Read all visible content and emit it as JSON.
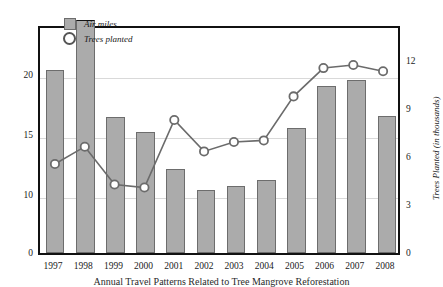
{
  "chart_data": {
    "type": "bar",
    "title": "",
    "categories": [
      "1997",
      "1998",
      "1999",
      "2000",
      "2001",
      "2002",
      "2003",
      "2004",
      "2005",
      "2006",
      "2007",
      "2008"
    ],
    "series": [
      {
        "name": "Air miles",
        "type": "bar",
        "axis": "left",
        "unit": "millions",
        "color": "#ababab",
        "values": [
          20.3,
          24.5,
          16.4,
          15.2,
          12.1,
          10.3,
          10.7,
          11.2,
          15.5,
          19.0,
          19.5,
          16.5
        ]
      },
      {
        "name": "Trees planted",
        "type": "line",
        "axis": "right",
        "unit": "thousands",
        "color": "#6b6b6b",
        "values": [
          5.6,
          6.7,
          4.3,
          4.1,
          8.4,
          6.4,
          7.0,
          7.1,
          9.9,
          11.7,
          11.9,
          11.5
        ]
      }
    ],
    "xlabel": "",
    "ylabel": "Annual Air Miles Flown (in millions)",
    "ylabel_right": "Trees Planted (in thousands)",
    "yticks_left": [
      "0",
      "10",
      "15",
      "20"
    ],
    "yticks_right": [
      "0",
      "3",
      "6",
      "9",
      "12"
    ],
    "ylim_left": [
      0,
      24.8
    ],
    "ylim_right": [
      0,
      13.2
    ],
    "grid": true,
    "legend_position": "top-left"
  },
  "axes": {
    "left_title": "Annual Air Miles Flown (in millions)",
    "right_title": "Trees Planted (in thousands)",
    "left_ticks": [
      {
        "label": "20",
        "top": 76
      },
      {
        "label": "15",
        "top": 136
      },
      {
        "label": "10",
        "top": 196
      },
      {
        "label": "0",
        "top": 254
      }
    ],
    "right_ticks": [
      {
        "label": "12",
        "top": 62
      },
      {
        "label": "9",
        "top": 110
      },
      {
        "label": "6",
        "top": 158
      },
      {
        "label": "3",
        "top": 206
      },
      {
        "label": "0",
        "top": 254
      }
    ]
  },
  "legend": {
    "bar_label": "Air miles",
    "line_label": "Trees planted"
  },
  "caption": "Annual Travel Patterns Related to Tree Mangrove Reforestation"
}
